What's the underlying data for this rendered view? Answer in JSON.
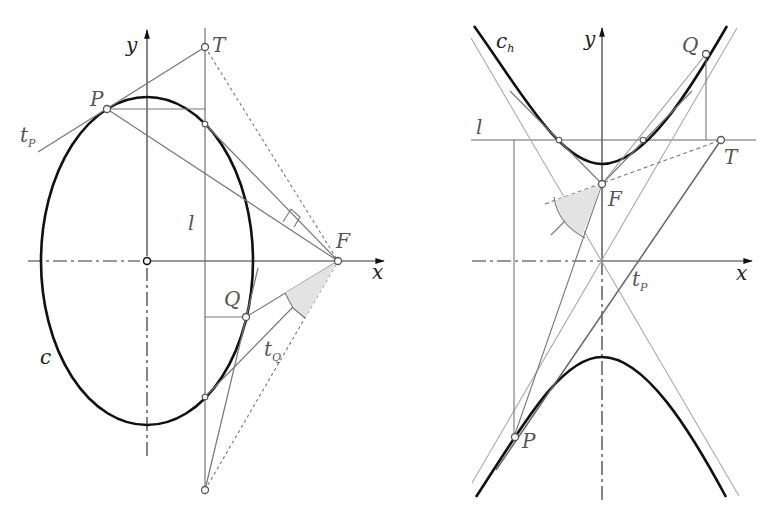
{
  "diagram": {
    "left_panel": {
      "title": "ellipse-directrix-construction",
      "labels": {
        "y_axis": "y",
        "x_axis": "x",
        "point_T": "T",
        "point_P": "P",
        "point_F": "F",
        "point_Q": "Q",
        "line_l": "l",
        "curve_c": "c",
        "tangent_P_main": "t",
        "tangent_P_sub": "P",
        "tangent_Q_main": "t",
        "tangent_Q_sub": "Q"
      }
    },
    "right_panel": {
      "title": "hyperbola-directrix-construction",
      "labels": {
        "y_axis": "y",
        "x_axis": "x",
        "curve_main": "c",
        "curve_sub": "h",
        "point_Q": "Q",
        "point_T": "T",
        "point_F": "F",
        "point_P": "P",
        "line_l": "l",
        "tangent_P_main": "t",
        "tangent_P_sub": "P"
      }
    },
    "colors": {
      "curve": "#111111",
      "construction": "#777777",
      "light_construction": "#aaaaaa",
      "angle_fill": "#e3e3e3"
    }
  }
}
